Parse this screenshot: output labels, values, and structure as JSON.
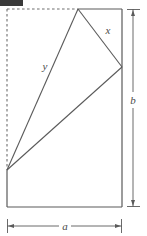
{
  "figure": {
    "type": "geometry-diagram",
    "background_color": "#ffffff",
    "line_color": "#5a5a5a",
    "dashed_color": "#6e6e6e",
    "label_color": "#4a4a4a"
  },
  "labels": {
    "x": "x",
    "y": "y",
    "a": "a",
    "b": "b"
  },
  "geometry": {
    "rectangle": {
      "left": 7,
      "top": 9,
      "right": 122,
      "bottom": 207,
      "width_label": "a",
      "height_label": "b"
    },
    "vertices": {
      "apex_top": [
        78,
        9
      ],
      "right": [
        122,
        67
      ],
      "lower_left": [
        7,
        170
      ]
    },
    "segments": [
      {
        "name": "x",
        "from": [
          78,
          9
        ],
        "to": [
          122,
          67
        ],
        "label": "x"
      },
      {
        "name": "y",
        "from": [
          78,
          9
        ],
        "to": [
          7,
          170
        ],
        "label": "y"
      },
      {
        "name": "hypotenuse",
        "from": [
          7,
          170
        ],
        "to": [
          122,
          67
        ],
        "label": ""
      }
    ],
    "dashed_edges": [
      "left-edge-upper",
      "top-edge-left-of-apex"
    ],
    "solid_edges": [
      "left-edge-lower",
      "top-edge-right-of-apex",
      "right-edge",
      "bottom-edge"
    ]
  },
  "dimensions": {
    "vertical": {
      "label": "b",
      "axis_x": 133,
      "from_y": 9,
      "to_y": 207,
      "label_x": 133,
      "label_y": 100
    },
    "horizontal": {
      "label": "a",
      "axis_y": 226,
      "from_x": 7,
      "to_x": 122,
      "label_x": 65,
      "label_y": 226
    }
  },
  "watermark": {
    "present": true,
    "color": "#3a3a3a"
  }
}
